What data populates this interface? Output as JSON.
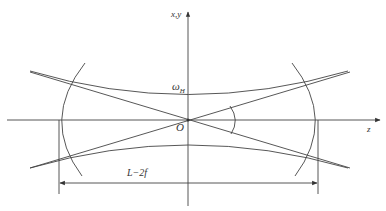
{
  "diagram": {
    "type": "optical resonator beam diagram",
    "axes": {
      "vertical_label": "x,y",
      "horizontal_label": "z",
      "origin_label": "O"
    },
    "labels": {
      "beam_waist": "ω",
      "beam_waist_subscript": "H",
      "dimension": "L−2f"
    },
    "elements": [
      {
        "name": "left-mirror",
        "shape": "arc"
      },
      {
        "name": "right-mirror",
        "shape": "arc"
      },
      {
        "name": "upper-beam-envelope",
        "shape": "hyperbola"
      },
      {
        "name": "lower-beam-envelope",
        "shape": "hyperbola"
      },
      {
        "name": "asymptote-1",
        "shape": "line"
      },
      {
        "name": "asymptote-2",
        "shape": "line"
      },
      {
        "name": "divergence-angle-arc",
        "shape": "arc"
      },
      {
        "name": "dimension-line",
        "shape": "double-arrow"
      }
    ],
    "colors": {
      "line": "#444444",
      "background": "#ffffff"
    }
  }
}
